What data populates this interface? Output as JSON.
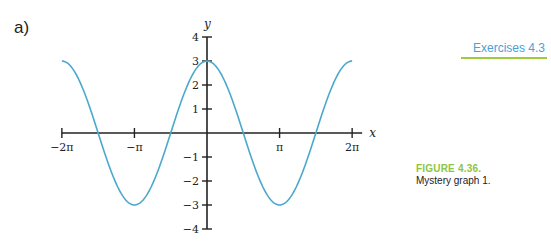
{
  "page": {
    "part_label": "a)",
    "section_tag": "Exercises 4.3",
    "figure_title": "FIGURE 4.36.",
    "figure_caption": "Mystery graph 1.",
    "colors": {
      "curve": "#4aa8cc",
      "axes": "#222222",
      "section_tag": "#4a9fd8",
      "section_rule": "#9ccc3c",
      "figure_title": "#8cc63f"
    }
  },
  "chart_data": {
    "type": "line",
    "title": "",
    "function": "y = 3cos(x)",
    "xlabel": "x",
    "ylabel": "y",
    "xlim": [
      -6.2832,
      6.2832
    ],
    "ylim": [
      -4,
      4
    ],
    "grid": false,
    "legend": null,
    "x_ticks": [
      {
        "value": -6.2832,
        "label": "−2π"
      },
      {
        "value": -3.1416,
        "label": "−π"
      },
      {
        "value": 3.1416,
        "label": "π"
      },
      {
        "value": 6.2832,
        "label": "2π"
      }
    ],
    "y_ticks": [
      {
        "value": 4,
        "label": "4"
      },
      {
        "value": 3,
        "label": "3"
      },
      {
        "value": 2,
        "label": "2"
      },
      {
        "value": 1,
        "label": "1"
      },
      {
        "value": -1,
        "label": "−1"
      },
      {
        "value": -2,
        "label": "−2"
      },
      {
        "value": -3,
        "label": "−3"
      },
      {
        "value": -4,
        "label": "−4"
      }
    ],
    "series": [
      {
        "name": "mystery graph 1",
        "x": [
          -6.2832,
          -4.7124,
          -3.1416,
          -1.5708,
          0,
          1.5708,
          3.1416,
          4.7124,
          6.2832
        ],
        "y": [
          3,
          0,
          -3,
          0,
          3,
          0,
          -3,
          0,
          3
        ]
      }
    ]
  }
}
